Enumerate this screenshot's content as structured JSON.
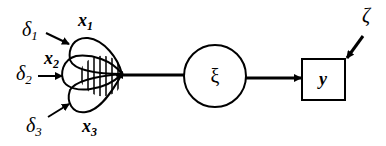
{
  "diagram": {
    "type": "structural-equation-model",
    "colors": {
      "stroke": "#000000",
      "background": "#ffffff"
    },
    "indicators": [
      {
        "id": "x1",
        "label": "x",
        "subscript": "1",
        "error": {
          "label": "δ",
          "subscript": "1"
        }
      },
      {
        "id": "x2",
        "label": "x",
        "subscript": "2",
        "error": {
          "label": "δ",
          "subscript": "2"
        }
      },
      {
        "id": "x3",
        "label": "x",
        "subscript": "3",
        "error": {
          "label": "δ",
          "subscript": "3"
        }
      }
    ],
    "latent": {
      "id": "xi",
      "label": "ξ",
      "shape": "circle"
    },
    "observed_outcome": {
      "id": "y",
      "label": "y",
      "shape": "square"
    },
    "disturbance": {
      "id": "zeta",
      "label": "ζ"
    },
    "edges": [
      {
        "from": "xi",
        "to": "indicator-overlap"
      },
      {
        "from": "xi",
        "to": "y"
      },
      {
        "from": "zeta",
        "to": "y"
      },
      {
        "from": "delta1",
        "to": "x1"
      },
      {
        "from": "delta2",
        "to": "x2"
      },
      {
        "from": "delta3",
        "to": "x3"
      }
    ]
  }
}
